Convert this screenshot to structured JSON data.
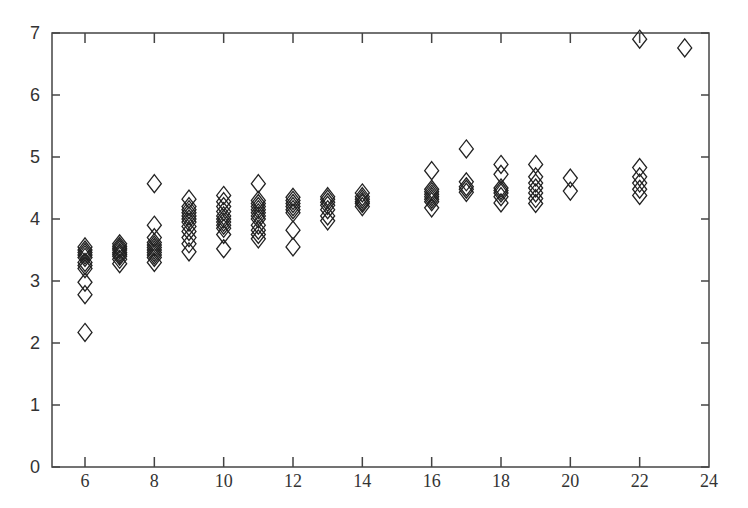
{
  "chart_data": {
    "type": "scatter",
    "title": "",
    "xlabel": "",
    "ylabel": "",
    "xlim": [
      4.1,
      24
    ],
    "ylim": [
      0,
      7
    ],
    "x_ticks": [
      6,
      8,
      10,
      12,
      14,
      16,
      18,
      20,
      22,
      24
    ],
    "y_ticks": [
      0,
      1,
      2,
      3,
      4,
      5,
      6,
      7
    ],
    "grid": false,
    "legend": null,
    "marker": "open-diamond",
    "marker_color": "#222222",
    "series": [
      {
        "name": "points",
        "points": [
          [
            6,
            2.17
          ],
          [
            6,
            2.78
          ],
          [
            6,
            2.98
          ],
          [
            6,
            3.2
          ],
          [
            6,
            3.25
          ],
          [
            6,
            3.3
          ],
          [
            6,
            3.38
          ],
          [
            6,
            3.42
          ],
          [
            6,
            3.46
          ],
          [
            6,
            3.5
          ],
          [
            6,
            3.55
          ],
          [
            7,
            3.28
          ],
          [
            7,
            3.35
          ],
          [
            7,
            3.4
          ],
          [
            7,
            3.43
          ],
          [
            7,
            3.46
          ],
          [
            7,
            3.5
          ],
          [
            7,
            3.53
          ],
          [
            7,
            3.56
          ],
          [
            7,
            3.6
          ],
          [
            8,
            3.3
          ],
          [
            8,
            3.38
          ],
          [
            8,
            3.42
          ],
          [
            8,
            3.46
          ],
          [
            8,
            3.5
          ],
          [
            8,
            3.54
          ],
          [
            8,
            3.58
          ],
          [
            8,
            3.62
          ],
          [
            8,
            3.7
          ],
          [
            8,
            3.9
          ],
          [
            8,
            4.57
          ],
          [
            9,
            3.47
          ],
          [
            9,
            3.6
          ],
          [
            9,
            3.7
          ],
          [
            9,
            3.8
          ],
          [
            9,
            3.88
          ],
          [
            9,
            3.95
          ],
          [
            9,
            4.0
          ],
          [
            9,
            4.05
          ],
          [
            9,
            4.1
          ],
          [
            9,
            4.15
          ],
          [
            9,
            4.2
          ],
          [
            9,
            4.32
          ],
          [
            10,
            3.52
          ],
          [
            10,
            3.75
          ],
          [
            10,
            3.85
          ],
          [
            10,
            3.9
          ],
          [
            10,
            3.95
          ],
          [
            10,
            4.0
          ],
          [
            10,
            4.05
          ],
          [
            10,
            4.12
          ],
          [
            10,
            4.2
          ],
          [
            10,
            4.28
          ],
          [
            10,
            4.38
          ],
          [
            11,
            3.68
          ],
          [
            11,
            3.75
          ],
          [
            11,
            3.82
          ],
          [
            11,
            3.9
          ],
          [
            11,
            4.0
          ],
          [
            11,
            4.05
          ],
          [
            11,
            4.1
          ],
          [
            11,
            4.15
          ],
          [
            11,
            4.2
          ],
          [
            11,
            4.25
          ],
          [
            11,
            4.3
          ],
          [
            11,
            4.57
          ],
          [
            12,
            3.55
          ],
          [
            12,
            3.82
          ],
          [
            12,
            4.1
          ],
          [
            12,
            4.15
          ],
          [
            12,
            4.2
          ],
          [
            12,
            4.25
          ],
          [
            12,
            4.3
          ],
          [
            12,
            4.35
          ],
          [
            13,
            3.97
          ],
          [
            13,
            4.05
          ],
          [
            13,
            4.15
          ],
          [
            13,
            4.22
          ],
          [
            13,
            4.27
          ],
          [
            13,
            4.32
          ],
          [
            13,
            4.36
          ],
          [
            14,
            4.2
          ],
          [
            14,
            4.25
          ],
          [
            14,
            4.28
          ],
          [
            14,
            4.32
          ],
          [
            14,
            4.36
          ],
          [
            14,
            4.42
          ],
          [
            16,
            4.18
          ],
          [
            16,
            4.28
          ],
          [
            16,
            4.32
          ],
          [
            16,
            4.36
          ],
          [
            16,
            4.4
          ],
          [
            16,
            4.44
          ],
          [
            16,
            4.48
          ],
          [
            16,
            4.78
          ],
          [
            17,
            4.43
          ],
          [
            17,
            4.48
          ],
          [
            17,
            4.52
          ],
          [
            17,
            4.6
          ],
          [
            17,
            5.13
          ],
          [
            18,
            4.26
          ],
          [
            18,
            4.36
          ],
          [
            18,
            4.42
          ],
          [
            18,
            4.46
          ],
          [
            18,
            4.5
          ],
          [
            18,
            4.72
          ],
          [
            18,
            4.88
          ],
          [
            19,
            4.25
          ],
          [
            19,
            4.33
          ],
          [
            19,
            4.42
          ],
          [
            19,
            4.5
          ],
          [
            19,
            4.58
          ],
          [
            19,
            4.68
          ],
          [
            19,
            4.88
          ],
          [
            20,
            4.45
          ],
          [
            20,
            4.66
          ],
          [
            22,
            4.38
          ],
          [
            22,
            4.48
          ],
          [
            22,
            4.58
          ],
          [
            22,
            4.68
          ],
          [
            22,
            4.83
          ],
          [
            22,
            6.9
          ],
          [
            23.3,
            6.76
          ]
        ]
      }
    ]
  },
  "axes": {
    "y_labels": [
      "0",
      "1",
      "2",
      "3",
      "4",
      "5",
      "6",
      "7"
    ],
    "x_labels": [
      "6",
      "8",
      "10",
      "12",
      "14",
      "16",
      "18",
      "20",
      "22",
      "24"
    ]
  }
}
